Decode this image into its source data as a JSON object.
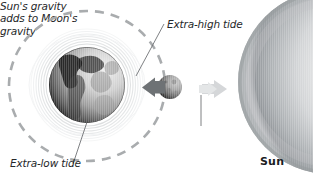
{
  "figure": {
    "background_color": "#ffffff"
  },
  "labels": {
    "extra_high_tide": "Extra-high tide",
    "extra_low_tide": "Extra-low tide",
    "sun_gravity_line1": "Sun's gravity",
    "sun_gravity_line2": "adds to Moon's",
    "sun_gravity_line3": "gravity",
    "sun": "Sun"
  },
  "bodies": {
    "earth": {
      "name": "Earth",
      "center_x": 87,
      "center_y": 85,
      "radius": 38,
      "shading": "lit from upper right, dark left limb"
    },
    "moon": {
      "name": "Moon",
      "center_x": 170,
      "center_y": 87,
      "radius": 12,
      "shading": "cratered, dark left half"
    },
    "sun": {
      "name": "Sun",
      "center_x": 330,
      "center_y": 82,
      "radius": 92,
      "shading": "dark gray limb at left, bright toward right"
    }
  },
  "orbit": {
    "name": "Moon orbit around Earth",
    "center_x": 87,
    "center_y": 86,
    "radius_x": 78,
    "radius_y": 75,
    "style": "dashed",
    "color": "#a9acae"
  },
  "tidal_bulge": {
    "name": "ocean water ripple halo",
    "color": "#d7d9db",
    "ring_count": 7
  },
  "arrows": {
    "moon_pull": {
      "label": "Moon's gravity pulling toward Earth",
      "direction": "left",
      "color": "#6e7275"
    },
    "sun_pull": {
      "label": "Sun's gravity pulling toward Sun",
      "direction": "right",
      "color": "#d2d4d6"
    }
  },
  "leader_lines": [
    {
      "name": "extra-high-tide-leader",
      "x1": 164,
      "y1": 24,
      "x2": 136,
      "y2": 76
    },
    {
      "name": "extra-low-tide-leader",
      "x1": 87,
      "y1": 122,
      "x2": 73,
      "y2": 164
    },
    {
      "name": "sun-gravity-leader",
      "x1": 201,
      "y1": 95,
      "x2": 201,
      "y2": 126
    }
  ],
  "colors": {
    "ink": "#26282a",
    "orbit_gray": "#a9acae",
    "ripple_gray": "#d7d9db",
    "sun_rim": "#8d9194"
  }
}
